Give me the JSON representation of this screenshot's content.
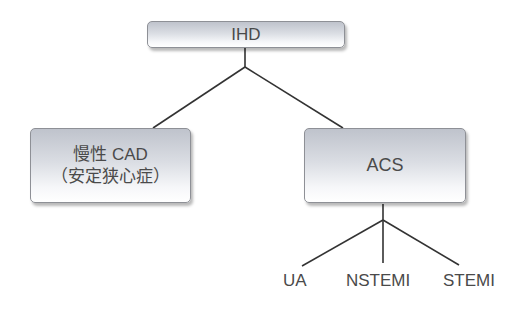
{
  "diagram": {
    "type": "tree",
    "root": {
      "label": "IHD"
    },
    "children": [
      {
        "id": "cad",
        "label_line1": "慢性 CAD",
        "label_line2": "（安定狭心症）"
      },
      {
        "id": "acs",
        "label": "ACS",
        "children": [
          {
            "label": "UA"
          },
          {
            "label": "NSTEMI"
          },
          {
            "label": "STEMI"
          }
        ]
      }
    ],
    "edges": [
      {
        "from": "IHD",
        "to": "慢性 CAD（安定狭心症）"
      },
      {
        "from": "IHD",
        "to": "ACS"
      },
      {
        "from": "ACS",
        "to": "UA"
      },
      {
        "from": "ACS",
        "to": "NSTEMI"
      },
      {
        "from": "ACS",
        "to": "STEMI"
      }
    ],
    "colors": {
      "line": "#333333",
      "text": "#4a4a4a",
      "box_border": "#8e9096",
      "box_gradient_top": "#bfc3cc",
      "box_gradient_bottom": "#ffffff"
    }
  }
}
